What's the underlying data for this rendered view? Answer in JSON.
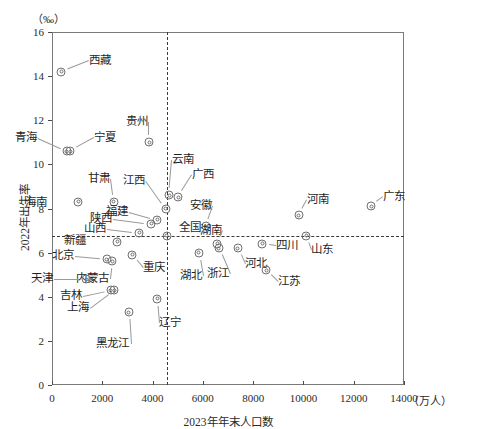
{
  "chart_data": {
    "type": "scatter",
    "title": "",
    "xlabel": "2023年年末人口数",
    "ylabel": "2022年出生率",
    "x_unit": "（万人）",
    "y_unit": "（‰）",
    "xlim": [
      0,
      14000
    ],
    "ylim": [
      0,
      16
    ],
    "x_ticks": [
      0,
      2000,
      4000,
      6000,
      8000,
      10000,
      12000,
      14000
    ],
    "y_ticks": [
      0,
      2,
      4,
      6,
      8,
      10,
      12,
      14,
      16
    ],
    "grid": false,
    "legend": "none",
    "reference_lines": {
      "vertical_x": 4560,
      "horizontal_y": 6.77,
      "style": "dashed"
    },
    "points": [
      {
        "name": "西藏",
        "x": 365,
        "y": 14.2,
        "lx": 28,
        "ly": -11,
        "leader": true
      },
      {
        "name": "青海",
        "x": 594,
        "y": 10.6,
        "lx": -41,
        "ly": -13,
        "leader": true
      },
      {
        "name": "宁夏",
        "x": 728,
        "y": 10.6,
        "lx": 24,
        "ly": -13,
        "leader": true
      },
      {
        "name": "贵州",
        "x": 3865,
        "y": 11.0,
        "lx": -12,
        "ly": -20,
        "leader": true
      },
      {
        "name": "甘肃",
        "x": 2465,
        "y": 8.3,
        "lx": -15,
        "ly": -23,
        "leader": true
      },
      {
        "name": "海南",
        "x": 1043,
        "y": 8.3,
        "lx": -42,
        "ly": 1,
        "leader": false
      },
      {
        "name": "云南",
        "x": 4673,
        "y": 8.6,
        "lx": 3,
        "ly": -35,
        "leader": true
      },
      {
        "name": "江西",
        "x": 4515,
        "y": 8.0,
        "lx": -32,
        "ly": -28,
        "leader": true
      },
      {
        "name": "广西",
        "x": 5027,
        "y": 8.5,
        "lx": 14,
        "ly": -22,
        "leader": true
      },
      {
        "name": "福建",
        "x": 4188,
        "y": 7.5,
        "lx": -40,
        "ly": -8,
        "leader": true
      },
      {
        "name": "陕西",
        "x": 3952,
        "y": 7.3,
        "lx": -50,
        "ly": -5,
        "leader": true
      },
      {
        "name": "安徽",
        "x": 6121,
        "y": 7.2,
        "lx": -5,
        "ly": -20,
        "leader": true
      },
      {
        "name": "河南",
        "x": 9815,
        "y": 7.7,
        "lx": 8,
        "ly": -15,
        "leader": true
      },
      {
        "name": "广东",
        "x": 12707,
        "y": 8.1,
        "lx": 12,
        "ly": -9,
        "leader": true
      },
      {
        "name": "山西",
        "x": 3466,
        "y": 6.9,
        "lx": -44,
        "ly": -4,
        "leader": true
      },
      {
        "name": "全国",
        "x": 4560,
        "y": 6.77,
        "lx": 12,
        "ly": -8,
        "leader": false
      },
      {
        "name": "湖南",
        "x": 6568,
        "y": 6.4,
        "lx": -6,
        "ly": -13,
        "leader": true
      },
      {
        "name": "四川",
        "x": 8368,
        "y": 6.4,
        "lx": 14,
        "ly": 2,
        "leader": true
      },
      {
        "name": "山东",
        "x": 10122,
        "y": 6.77,
        "lx": 5,
        "ly": 14,
        "leader": true
      },
      {
        "name": "新疆",
        "x": 2587,
        "y": 6.5,
        "lx": -42,
        "ly": -1,
        "leader": false
      },
      {
        "name": "北京",
        "x": 2186,
        "y": 5.7,
        "lx": -44,
        "ly": -3,
        "leader": true
      },
      {
        "name": "重庆",
        "x": 3191,
        "y": 5.9,
        "lx": 11,
        "ly": 13,
        "leader": true
      },
      {
        "name": "内蒙古",
        "x": 2396,
        "y": 5.6,
        "lx": -14,
        "ly": 18,
        "leader": true
      },
      {
        "name": "湖北",
        "x": 5844,
        "y": 6.0,
        "lx": -8,
        "ly": 23,
        "leader": true
      },
      {
        "name": "浙江",
        "x": 6627,
        "y": 6.2,
        "lx": -1,
        "ly": 26,
        "leader": true
      },
      {
        "name": "河北",
        "x": 7393,
        "y": 6.2,
        "lx": 7,
        "ly": 16,
        "leader": true
      },
      {
        "name": "江苏",
        "x": 8526,
        "y": 5.2,
        "lx": 12,
        "ly": 12,
        "leader": true
      },
      {
        "name": "天津",
        "x": 1364,
        "y": 4.8,
        "lx": -44,
        "ly": 0,
        "leader": true
      },
      {
        "name": "吉林",
        "x": 2339,
        "y": 4.3,
        "lx": -40,
        "ly": 6,
        "leader": true
      },
      {
        "name": "上海",
        "x": 2475,
        "y": 4.3,
        "lx": -36,
        "ly": 18,
        "leader": true
      },
      {
        "name": "辽宁",
        "x": 4182,
        "y": 3.9,
        "lx": 2,
        "ly": 24,
        "leader": true
      },
      {
        "name": "黑龙江",
        "x": 3062,
        "y": 3.3,
        "lx": -10,
        "ly": 32,
        "leader": true
      }
    ]
  },
  "axes": {
    "x_tick_labels": [
      "0",
      "2000",
      "4000",
      "6000",
      "8000",
      "10000",
      "12000",
      "14000"
    ],
    "y_tick_labels": [
      "0",
      "2",
      "4",
      "6",
      "8",
      "10",
      "12",
      "14",
      "16"
    ],
    "x_title": "2023年年末人口数",
    "y_title": "2022年出生率",
    "x_unit_label": "（万人）",
    "y_unit_label": "（‰）"
  },
  "style": {
    "frame_color": "#7a7a7a",
    "marker_color": "#6f6f6f",
    "text_color": "#1f1f1f",
    "dash_color": "#3a3a3a"
  }
}
